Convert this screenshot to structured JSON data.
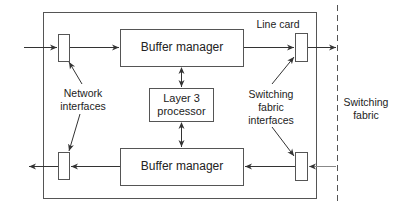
{
  "diagram": {
    "line_card_label": "Line card",
    "buffer_manager_top": "Buffer manager",
    "buffer_manager_bottom": "Buffer manager",
    "layer3_line1": "Layer 3",
    "layer3_line2": "processor",
    "network_interfaces_line1": "Network",
    "network_interfaces_line2": "interfaces",
    "switching_fabric_interfaces_line1": "Switching",
    "switching_fabric_interfaces_line2": "fabric",
    "switching_fabric_interfaces_line3": "interfaces",
    "switching_fabric_line1": "Switching",
    "switching_fabric_line2": "fabric"
  },
  "colors": {
    "stroke": "#555555",
    "text": "#222222"
  }
}
